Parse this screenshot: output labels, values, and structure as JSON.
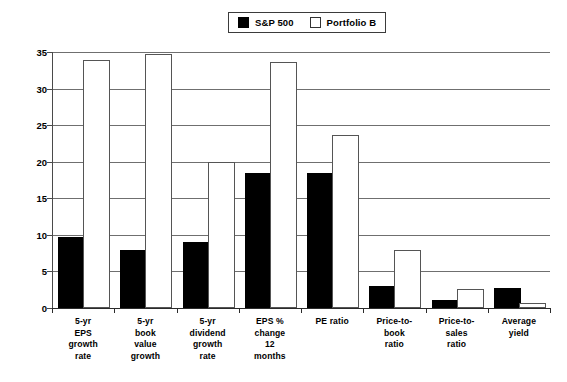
{
  "legend": {
    "position": "top-center",
    "entries": [
      {
        "label": "S&P 500",
        "swatch": "filled-square-icon",
        "color": "#000000"
      },
      {
        "label": "Portfolio B",
        "swatch": "open-square-icon",
        "color": "#ffffff"
      }
    ]
  },
  "axis": {
    "y_ticks": [
      "0",
      "5",
      "10",
      "15",
      "20",
      "25",
      "30",
      "35"
    ]
  },
  "chart_data": {
    "type": "bar",
    "title": "",
    "subtitle": "",
    "xlabel": "",
    "ylabel": "",
    "ylim": [
      0,
      35
    ],
    "yticks": [
      0,
      5,
      10,
      15,
      20,
      25,
      30,
      35
    ],
    "grid": true,
    "legend_position": "top-center",
    "categories": [
      "5-yr EPS growth rate",
      "5-yr book value growth",
      "5-yr dividend growth rate",
      "EPS % change 12 months",
      "PE  ratio",
      "Price-to-book ratio",
      "Price-to-sales ratio",
      "Average yield"
    ],
    "category_lines": [
      [
        "5-yr",
        "EPS",
        "growth",
        "rate"
      ],
      [
        "5-yr",
        "book",
        "value",
        "growth"
      ],
      [
        "5-yr",
        "dividend",
        "growth",
        "rate"
      ],
      [
        "EPS %",
        "change",
        "12",
        "months"
      ],
      [
        "PE  ratio"
      ],
      [
        "Price-to-",
        "book",
        "ratio"
      ],
      [
        "Price-to-",
        "sales",
        "ratio"
      ],
      [
        "Average",
        "yield"
      ]
    ],
    "series": [
      {
        "name": "S&P 500",
        "color": "#000000",
        "values": [
          9.4,
          7.7,
          8.8,
          18.2,
          18.2,
          2.7,
          0.8,
          2.4
        ]
      },
      {
        "name": "Portfolio B",
        "color": "#ffffff",
        "values": [
          33.7,
          34.5,
          19.7,
          33.4,
          23.4,
          7.6,
          2.3,
          0.4
        ]
      }
    ]
  }
}
